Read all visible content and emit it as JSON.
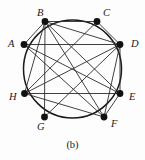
{
  "figure": {
    "caption": "(b)",
    "kind": "circular-graph-diagram"
  },
  "colors": {
    "ink": "#1a1a1a",
    "edge": "#2b2b2b",
    "circle": "#1a1a1a",
    "vertex_fill": "#111111",
    "background": "#fdfdfd"
  },
  "chart_data": {
    "type": "diagram",
    "title": "(b)",
    "layout": "circular",
    "circle": {
      "cx": 72.5,
      "cy": 69,
      "r": 49
    },
    "vertex_radius": 3.4,
    "nodes": [
      {
        "id": "A",
        "label": "A",
        "x": 24.0,
        "y": 44.5,
        "label_x": 8,
        "label_y": 39,
        "degree": 4
      },
      {
        "id": "B",
        "label": "B",
        "x": 45.0,
        "y": 21.5,
        "label_x": 37,
        "label_y": 8,
        "degree": 6
      },
      {
        "id": "C",
        "label": "C",
        "x": 97.0,
        "y": 21.5,
        "label_x": 103,
        "label_y": 8,
        "degree": 3
      },
      {
        "id": "D",
        "label": "D",
        "x": 120.0,
        "y": 44.5,
        "label_x": 131,
        "label_y": 39,
        "degree": 7
      },
      {
        "id": "E",
        "label": "E",
        "x": 120.0,
        "y": 93.5,
        "label_x": 129,
        "label_y": 92,
        "degree": 3
      },
      {
        "id": "F",
        "label": "F",
        "x": 104.0,
        "y": 117.0,
        "label_x": 111,
        "label_y": 119,
        "degree": 7
      },
      {
        "id": "G",
        "label": "G",
        "x": 44.5,
        "y": 117.0,
        "label_x": 37,
        "label_y": 122,
        "degree": 0
      },
      {
        "id": "H",
        "label": "H",
        "x": 24.5,
        "y": 93.5,
        "label_x": 9,
        "label_y": 92,
        "degree": 6
      }
    ],
    "edges": [
      {
        "from": "A",
        "to": "B"
      },
      {
        "from": "A",
        "to": "D"
      },
      {
        "from": "A",
        "to": "E"
      },
      {
        "from": "A",
        "to": "F"
      },
      {
        "from": "B",
        "to": "C"
      },
      {
        "from": "B",
        "to": "D"
      },
      {
        "from": "B",
        "to": "E"
      },
      {
        "from": "B",
        "to": "F"
      },
      {
        "from": "B",
        "to": "H"
      },
      {
        "from": "C",
        "to": "D"
      },
      {
        "from": "C",
        "to": "H"
      },
      {
        "from": "D",
        "to": "E"
      },
      {
        "from": "D",
        "to": "F"
      },
      {
        "from": "D",
        "to": "H"
      },
      {
        "from": "E",
        "to": "F"
      },
      {
        "from": "E",
        "to": "H"
      },
      {
        "from": "F",
        "to": "H"
      },
      {
        "from": "D",
        "to": "G"
      },
      {
        "from": "B",
        "to": "G"
      }
    ],
    "arc_edges": [
      {
        "from": "A",
        "to": "B"
      },
      {
        "from": "B",
        "to": "C"
      },
      {
        "from": "C",
        "to": "D"
      },
      {
        "from": "D",
        "to": "E"
      },
      {
        "from": "E",
        "to": "F"
      },
      {
        "from": "F",
        "to": "G"
      },
      {
        "from": "G",
        "to": "H"
      },
      {
        "from": "H",
        "to": "A"
      }
    ]
  }
}
